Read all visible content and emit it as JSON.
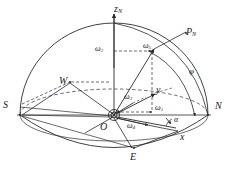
{
  "figure": {
    "kind": "3d-sphere-vector-diagram",
    "background_color": "#ffffff",
    "line_color": "#2b2b2b"
  },
  "labels": {
    "z_axis": {
      "text": "z",
      "sub": "N",
      "x": 114,
      "y": 4
    },
    "point_pn": {
      "text": "P",
      "sub": "N",
      "x": 186,
      "y": 27
    },
    "omega_2": {
      "text": "ω",
      "sub": "2",
      "x": 95,
      "y": 45
    },
    "omega_5": {
      "text": "ω",
      "sub": "5",
      "x": 143,
      "y": 42
    },
    "west": {
      "text": "W",
      "sub": "",
      "x": 59,
      "y": 76
    },
    "south": {
      "text": "S",
      "sub": "",
      "x": 3,
      "y": 100
    },
    "north": {
      "text": "N",
      "sub": "",
      "x": 215,
      "y": 101
    },
    "y_axis": {
      "text": "y",
      "sub": "",
      "x": 156,
      "y": 85
    },
    "x_axis": {
      "text": "x",
      "sub": "",
      "x": 180,
      "y": 132
    },
    "omega_3": {
      "text": "ω",
      "sub": "3",
      "x": 124,
      "y": 93
    },
    "omega_1": {
      "text": "ω",
      "sub": "1",
      "x": 155,
      "y": 104
    },
    "omega_4": {
      "text": "ω",
      "sub": "4",
      "x": 127,
      "y": 122
    },
    "origin": {
      "text": "O",
      "sub": "",
      "x": 100,
      "y": 122
    },
    "east": {
      "text": "E",
      "sub": "",
      "x": 130,
      "y": 152
    },
    "phi": {
      "text": "φ",
      "sub": "",
      "x": 189,
      "y": 67
    },
    "alpha": {
      "text": "α",
      "sub": "",
      "x": 174,
      "y": 116
    }
  },
  "geometry": {
    "origin": {
      "x": 114,
      "y": 115
    },
    "sphere_outline": "hemisphere dome plus lower ellipse arc",
    "equator_ellipse": {
      "cx": 114,
      "cy": 92,
      "rx": 94,
      "ry": 26
    },
    "meridian_arc": "from zenith through P_N to N",
    "axes": [
      "z_N up",
      "y toward horizon",
      "x toward lower right"
    ],
    "vectors": [
      "omega_1",
      "omega_2",
      "omega_3",
      "omega_4",
      "omega_5"
    ]
  }
}
